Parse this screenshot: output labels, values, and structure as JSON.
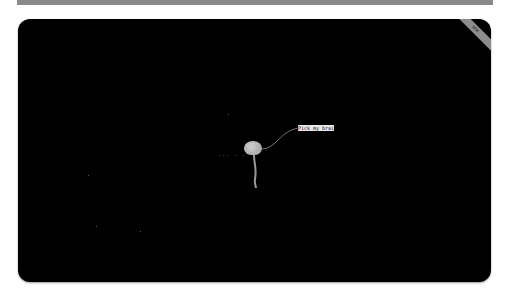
{
  "frame": {
    "top_bar_color": "#8a8a8a",
    "screen_color": "#000000",
    "corner_ribbon_label": "NEW"
  },
  "scene": {
    "brain_label": "Pick my brain",
    "trail_dots": "--- · ·",
    "brain_color": "#b5b5b5",
    "label_bg": "#e8e8e8"
  }
}
